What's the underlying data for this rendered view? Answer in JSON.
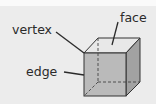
{
  "diagram": {
    "labels": {
      "vertex": "vertex",
      "face": "face",
      "edge": "edge"
    },
    "colors": {
      "background": "#ececec",
      "front_face": "#b9b9b9",
      "top_face": "#e6e6e6",
      "side_face": "#9e9e9e",
      "line": "#2a2a2a"
    }
  }
}
